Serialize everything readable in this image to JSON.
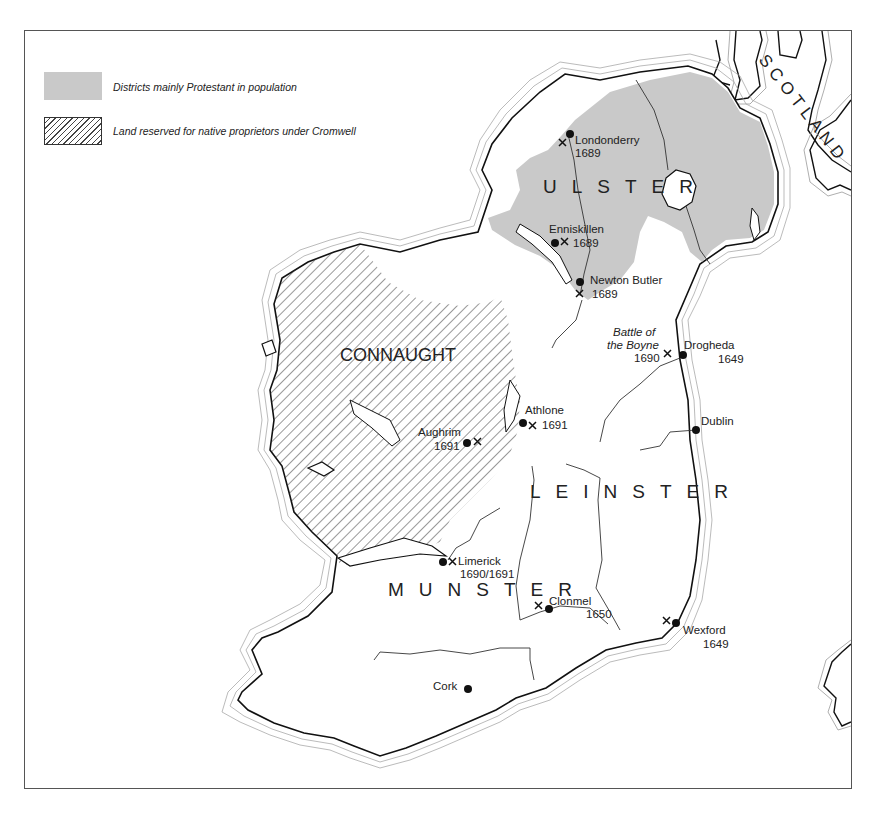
{
  "legend": {
    "items": [
      {
        "label": "Districts mainly Protestant in population",
        "pattern": "solid-grey",
        "color": "#c9c9c9"
      },
      {
        "label": "Land reserved for native proprietors under Cromwell",
        "pattern": "diagonal-hatch",
        "color": "#444444"
      }
    ]
  },
  "regions": {
    "ulster": "ULSTER",
    "connaught": "CONNAUGHT",
    "leinster": "LEINSTER",
    "munster": "MUNSTER",
    "scotland": "SCOTLAND"
  },
  "places": [
    {
      "name": "Londonderry",
      "year": "1689",
      "town": true,
      "battle": true
    },
    {
      "name": "Enniskillen",
      "year": "1689",
      "town": true,
      "battle": true
    },
    {
      "name": "Newton Butler",
      "year": "1689",
      "town": true,
      "battle": true
    },
    {
      "name": "Battle of the Boyne",
      "year": "1690",
      "town": false,
      "battle": true
    },
    {
      "name": "Drogheda",
      "year": "1649",
      "town": true,
      "battle": false
    },
    {
      "name": "Dublin",
      "year": "",
      "town": true,
      "battle": false
    },
    {
      "name": "Athlone",
      "year": "1691",
      "town": true,
      "battle": true
    },
    {
      "name": "Aughrim",
      "year": "1691",
      "town": true,
      "battle": true
    },
    {
      "name": "Limerick",
      "year": "1690/1691",
      "town": true,
      "battle": true
    },
    {
      "name": "Clonmel",
      "year": "1650",
      "town": true,
      "battle": true
    },
    {
      "name": "Wexford",
      "year": "1649",
      "town": true,
      "battle": true
    },
    {
      "name": "Cork",
      "year": "",
      "town": true,
      "battle": false
    }
  ],
  "labels": {
    "boyne_line1": "Battle of",
    "boyne_line2": "the Boyne"
  },
  "symbols": {
    "town": "filled-circle",
    "battle": "crossed-swords-x"
  },
  "colors": {
    "protestant_fill": "#c9c9c9",
    "coast": "#111111",
    "background": "#ffffff"
  }
}
